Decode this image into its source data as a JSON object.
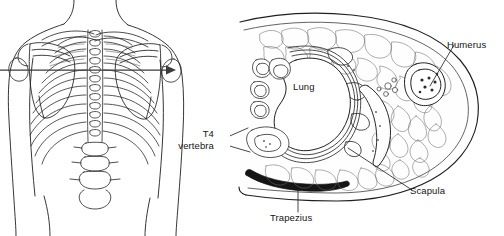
{
  "figure": {
    "type": "anatomical-illustration",
    "background_color": "#ffffff",
    "ink_color": "#1a1a1a"
  },
  "panels": {
    "left": {
      "name": "posterior-thorax-skeleton",
      "view": "posterior",
      "section_indicator": {
        "type": "arrow",
        "orientation": "horizontal",
        "direction": "left-to-right"
      },
      "structures": [
        "neck",
        "clavicle",
        "scapula",
        "humerus",
        "thoracic-vertebrae",
        "ribs",
        "lumbar-vertebrae",
        "torso-outline"
      ]
    },
    "right": {
      "name": "transverse-section-t4",
      "view": "transverse-cross-section",
      "level": "T4",
      "structures": [
        "skin-and-subcutaneous-fat",
        "trapezius",
        "lung",
        "pleura",
        "ribs",
        "scapula",
        "humerus",
        "t4-vertebra",
        "mediastinum",
        "deltoid-and-rotator-muscles"
      ]
    }
  },
  "labels": {
    "lung": "Lung",
    "humerus": "Humerus",
    "scapula": "Scapula",
    "trapezius": "Trapezius",
    "t4_line1": "T4",
    "t4_line2": "vertebra"
  }
}
